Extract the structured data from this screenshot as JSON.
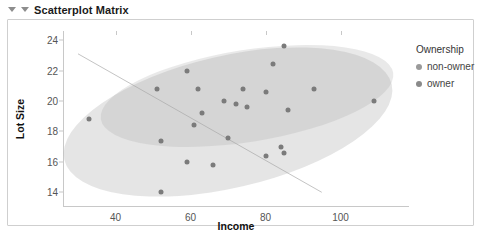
{
  "panel": {
    "title": "Scatterplot Matrix",
    "caret_outer": "triangle-down",
    "caret_inner": "triangle-down"
  },
  "legend": {
    "title": "Ownership",
    "items": [
      {
        "label": "non-owner",
        "color": "#9a9a9a"
      },
      {
        "label": "owner",
        "color": "#8a8a8a"
      }
    ]
  },
  "chart_data": {
    "type": "scatter",
    "title": "Scatterplot Matrix",
    "xlabel": "Income",
    "ylabel": "Lot Size",
    "xlim": [
      26,
      118
    ],
    "ylim": [
      13.1,
      24.6
    ],
    "xticks": [
      40,
      60,
      80,
      100
    ],
    "yticks": [
      14,
      16,
      18,
      20,
      22,
      24
    ],
    "grid": false,
    "legend_position": "right",
    "point_color": "#7b7b7b",
    "series": [
      {
        "name": "non-owner",
        "color": "#9a9a9a",
        "points": [
          [
            33,
            18.8
          ],
          [
            51,
            20.8
          ],
          [
            52,
            17.4
          ],
          [
            52,
            14.0
          ],
          [
            59,
            16.0
          ],
          [
            61,
            18.4
          ],
          [
            66,
            15.8
          ],
          [
            70,
            17.6
          ],
          [
            75,
            19.6
          ],
          [
            80,
            16.4
          ],
          [
            84,
            17.0
          ],
          [
            85,
            16.6
          ]
        ]
      },
      {
        "name": "owner",
        "color": "#8a8a8a",
        "points": [
          [
            59,
            22.0
          ],
          [
            62,
            20.8
          ],
          [
            63,
            19.2
          ],
          [
            69,
            20.0
          ],
          [
            72,
            19.8
          ],
          [
            74,
            20.8
          ],
          [
            80,
            20.6
          ],
          [
            82,
            22.4
          ],
          [
            85,
            23.6
          ],
          [
            86,
            19.4
          ],
          [
            93,
            20.8
          ],
          [
            109,
            20.0
          ]
        ]
      }
    ],
    "annotations": [
      {
        "type": "ellipse",
        "name": "non-owner-confidence-ellipse",
        "center": [
          70,
          18.6
        ],
        "rotation_deg": -13,
        "fill": "rgba(170,170,170,0.30)"
      },
      {
        "type": "ellipse",
        "name": "owner-confidence-ellipse",
        "center": [
          75,
          20.3
        ],
        "rotation_deg": -9,
        "fill": "rgba(170,170,170,0.26)"
      },
      {
        "type": "line",
        "name": "regression-line",
        "from": [
          30,
          23.1
        ],
        "to": [
          95,
          14.0
        ],
        "color": "#c4c4c4"
      }
    ]
  }
}
